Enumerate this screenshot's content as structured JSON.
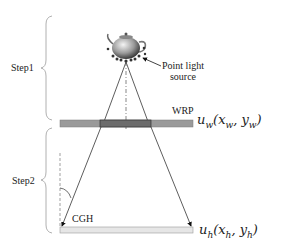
{
  "diagram": {
    "steps": [
      {
        "id": "step1",
        "label": "Step1"
      },
      {
        "id": "step2",
        "label": "Step2"
      }
    ],
    "object": {
      "label_line1": "Point light",
      "label_line2": "source"
    },
    "planes": {
      "wrp": {
        "label": "WRP",
        "field_base": "u",
        "field_sub": "w",
        "args": "(x",
        "args_sub1": "w",
        "comma": ", y",
        "args_sub2": "w",
        "close": ")"
      },
      "cgh": {
        "label": "CGH",
        "field_base": "u",
        "field_sub": "h",
        "args": "(x",
        "args_sub1": "h",
        "comma": ", y",
        "args_sub2": "h",
        "close": ")"
      }
    },
    "colors": {
      "wrp_bar": "#9a9a9a",
      "wrp_highlight": "#6c6c6c",
      "cgh_bar": "#e6e6e6",
      "lines": "#333333",
      "brace": "#aaaaaa"
    }
  }
}
